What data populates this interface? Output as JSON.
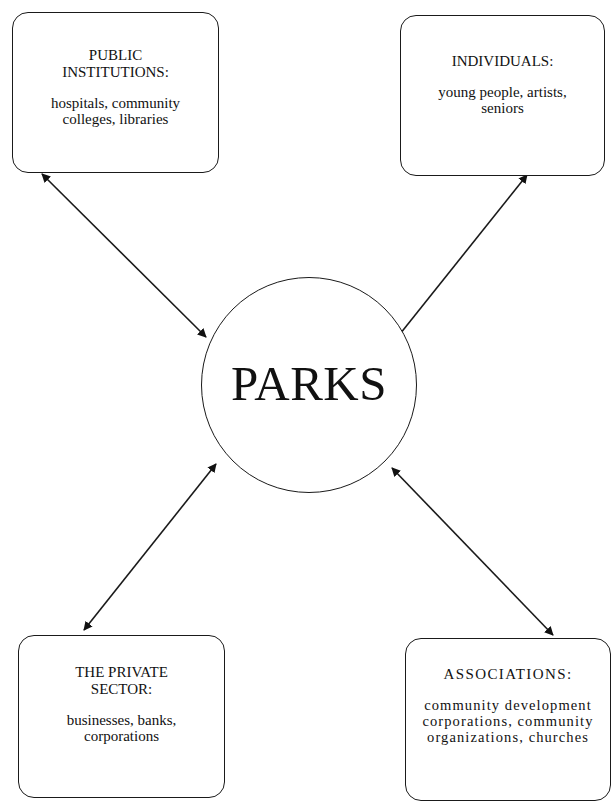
{
  "diagram": {
    "type": "hub-and-spoke",
    "hub": {
      "label": "PARKS",
      "shape": "circle"
    },
    "nodes": [
      {
        "id": "public",
        "position": "top-left",
        "title_line1": "PUBLIC",
        "title_line2": "INSTITUTIONS:",
        "body_line1": "hospitals, community",
        "body_line2": "colleges, libraries"
      },
      {
        "id": "individuals",
        "position": "top-right",
        "title_line1": "INDIVIDUALS:",
        "body_line1": "young people, artists,",
        "body_line2": "seniors"
      },
      {
        "id": "private",
        "position": "bottom-left",
        "title_line1": "THE PRIVATE",
        "title_line2": "SECTOR:",
        "body_line1": "businesses, banks,",
        "body_line2": "corporations"
      },
      {
        "id": "associations",
        "position": "bottom-right",
        "title_line1": "ASSOCIATIONS:",
        "body_line1": "community development",
        "body_line2": "corporations, community",
        "body_line3": "organizations, churches"
      }
    ],
    "edges": [
      {
        "from": "public",
        "to": "hub",
        "direction": "bidirectional"
      },
      {
        "from": "individuals",
        "to": "hub",
        "direction": "bidirectional"
      },
      {
        "from": "private",
        "to": "hub",
        "direction": "bidirectional"
      },
      {
        "from": "associations",
        "to": "hub",
        "direction": "bidirectional"
      }
    ],
    "colors": {
      "stroke": "#1a1a1a",
      "background": "#ffffff",
      "text": "#111111"
    }
  }
}
